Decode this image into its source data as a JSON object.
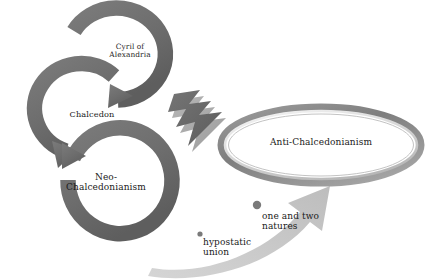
{
  "diagram": {
    "background_color": "#ffffff",
    "cycle_color": "#6f6f6f",
    "bolt_color": "#6b6b6b",
    "sweep_arrow_color": "#c9c9c9",
    "ellipse_ring_color": "#8a8a8a",
    "text_color": "#1a1a1a",
    "dot_color": "#7a7a7a"
  },
  "cycle": {
    "steps": [
      {
        "id": "cyril",
        "label": "Cyril of\nAlexandria"
      },
      {
        "id": "chalcedon",
        "label": "Chalcedon"
      },
      {
        "id": "neo-chalcedonianism",
        "label": "Neo-\nChalcedonianism"
      }
    ]
  },
  "opposition": {
    "label": "Anti-Chalcedonianism"
  },
  "annotations": [
    {
      "id": "natures",
      "label": "one and two\nnatures",
      "bullet": "dot"
    },
    {
      "id": "hypostatic-union",
      "label": "hypostatic\nunion",
      "bullet": "dot"
    }
  ]
}
